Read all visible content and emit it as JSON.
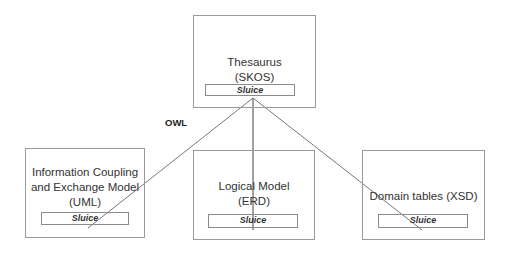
{
  "diagram": {
    "top": {
      "title_line1": "Thesaurus",
      "title_line2": "(SKOS)",
      "component": "Sluice"
    },
    "edge_label": "OWL",
    "children": [
      {
        "line1": "Information Coupling",
        "line2": "and Exchange Model",
        "line3": "(UML)",
        "component": "Sluice"
      },
      {
        "line1": "Logical Model",
        "line2": "(ERD)",
        "component": "Sluice"
      },
      {
        "line1": "Domain tables (XSD)",
        "component": "Sluice"
      }
    ]
  }
}
